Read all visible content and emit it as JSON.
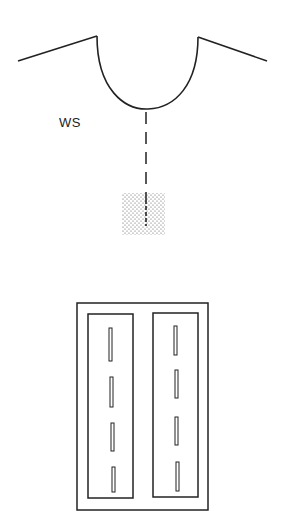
{
  "diagram": {
    "labels": {
      "ws": "WS"
    },
    "colors": {
      "stroke": "#222222",
      "background": "#ffffff",
      "stipple": "#555555"
    },
    "top_figure": {
      "description": "Cross-section: surface line with U-shaped depression, dashed line descending to stippled rectangular region",
      "surface_left": {
        "x1": 18,
        "y1": 61,
        "x2": 97,
        "y2": 36
      },
      "surface_right": {
        "x1": 198,
        "y1": 37,
        "x2": 267,
        "y2": 61
      },
      "depression_bottom": {
        "x": 148,
        "y": 109
      },
      "dashed_line": {
        "x": 146,
        "y_start": 112,
        "y_end": 225
      },
      "stippled_region": {
        "x": 122,
        "y": 193,
        "width": 43,
        "height": 42
      }
    },
    "bottom_figure": {
      "description": "Plan view: outer rectangle containing two inner rectangles, each with four vertical slots",
      "outer": {
        "x": 77,
        "y": 303,
        "width": 131,
        "height": 207
      },
      "inner_panels": [
        {
          "x": 88,
          "y": 314,
          "width": 45,
          "height": 184,
          "slots": 4
        },
        {
          "x": 153,
          "y": 313,
          "width": 45,
          "height": 184,
          "slots": 4
        }
      ]
    }
  }
}
